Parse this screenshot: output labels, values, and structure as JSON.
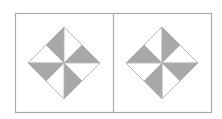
{
  "figure": {
    "colors": {
      "background": "#ffffff",
      "frame": "#a9a9a9",
      "shade": "#a8a8a8",
      "line": "#b4b4b4"
    },
    "panels": [
      {
        "name": "left-panel",
        "center": [
          64,
          63
        ],
        "radius": 36,
        "shaded": [
          "ul-top",
          "ur-right",
          "lr-bottom",
          "ll-left"
        ]
      },
      {
        "name": "right-panel",
        "center": [
          162,
          63
        ],
        "radius": 36,
        "shaded": [
          "ul-left",
          "ur-top",
          "lr-right",
          "ll-bottom"
        ]
      }
    ]
  }
}
